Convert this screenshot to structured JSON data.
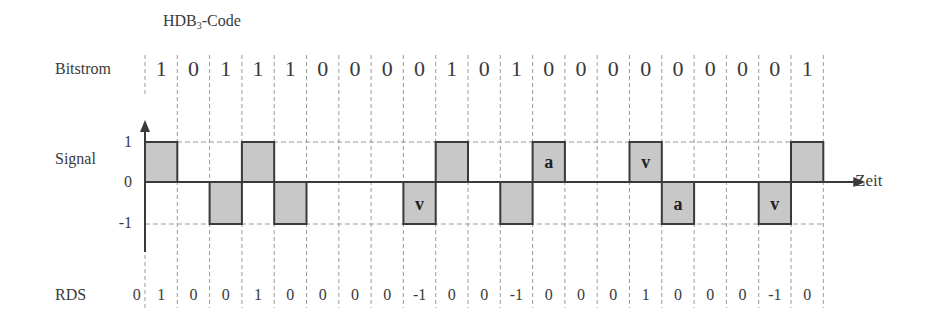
{
  "title": {
    "prefix": "HDB",
    "subscript": "3",
    "suffix": "-Code"
  },
  "labels": {
    "bitstream": "Bitstrom",
    "signal": "Signal",
    "rds": "RDS",
    "time_axis": "Zeit",
    "ticks": [
      "1",
      "0",
      "-1"
    ]
  },
  "colors": {
    "pulse_fill": "#c8c8c8",
    "pulse_stroke": "#3a3a3a",
    "grid": "#9a9a9a",
    "axis": "#3a3a3a",
    "text": "#3a3a3a"
  },
  "chart_data": {
    "type": "line",
    "title": "HDB3-Code",
    "xlabel": "Zeit",
    "ylabel": "Signal",
    "ylim": [
      -1,
      1
    ],
    "yticks": [
      1,
      0,
      -1
    ],
    "grid": true,
    "bitstream": [
      1,
      0,
      1,
      1,
      1,
      0,
      0,
      0,
      0,
      1,
      0,
      1,
      0,
      0,
      0,
      0,
      0,
      0,
      0,
      0,
      1
    ],
    "signal": [
      1,
      0,
      -1,
      1,
      -1,
      0,
      0,
      0,
      -1,
      1,
      0,
      -1,
      1,
      0,
      0,
      1,
      -1,
      0,
      0,
      -1,
      1
    ],
    "markers": [
      {
        "cell": 8,
        "label": "v"
      },
      {
        "cell": 12,
        "label": "a"
      },
      {
        "cell": 15,
        "label": "v"
      },
      {
        "cell": 16,
        "label": "a"
      },
      {
        "cell": 19,
        "label": "v"
      }
    ],
    "rds": [
      "0",
      "1",
      "0",
      "0",
      "1",
      "0",
      "0",
      "0",
      "0",
      "-1",
      "0",
      "0",
      "-1",
      "0",
      "0",
      "0",
      "1",
      "0",
      "0",
      "0",
      "-1",
      "0"
    ]
  }
}
